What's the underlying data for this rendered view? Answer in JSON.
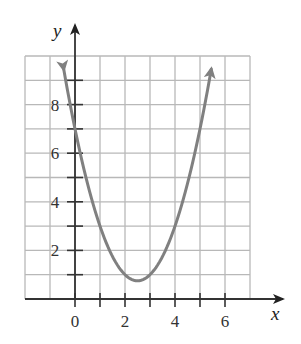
{
  "chart_data": {
    "type": "line",
    "title": "",
    "xlabel": "x",
    "ylabel": "y",
    "xlim": [
      -2,
      7
    ],
    "ylim": [
      0,
      10
    ],
    "grid": true,
    "grid_step": 1,
    "x_ticks": [
      0,
      1,
      2,
      3,
      4,
      5,
      6
    ],
    "x_tick_labels": [
      "0",
      "2",
      "4",
      "6"
    ],
    "x_tick_label_values": [
      0,
      2,
      4,
      6
    ],
    "y_ticks": [
      1,
      2,
      3,
      4,
      5,
      6,
      7,
      8,
      9
    ],
    "y_tick_labels": [
      "2",
      "4",
      "6",
      "8"
    ],
    "y_tick_label_values": [
      2,
      4,
      6,
      8
    ],
    "series": [
      {
        "name": "parabola",
        "equation": "y = x^2 - 5x + 7",
        "vertex": [
          2.5,
          0.75
        ],
        "y_intercept": 7,
        "color": "#808080",
        "arrows_at_ends": true,
        "x": [
          -0.45,
          0,
          0.5,
          1,
          1.5,
          2,
          2.5,
          3,
          3.5,
          4,
          4.5,
          5,
          5.45
        ],
        "values": [
          9.45,
          7,
          4.75,
          3,
          1.75,
          1,
          0.75,
          1,
          1.75,
          3,
          4.75,
          7,
          9.45
        ]
      }
    ]
  },
  "colors": {
    "grid": "#b8b8b8",
    "axis": "#333333",
    "curve": "#808080"
  }
}
